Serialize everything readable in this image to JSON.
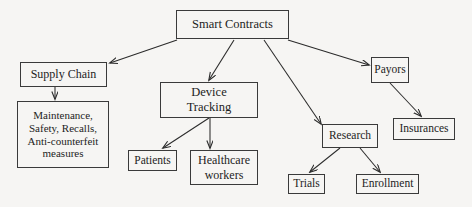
{
  "diagram": {
    "type": "tree-hierarchy",
    "root_label": "Smart Contracts",
    "colors": {
      "background": "#f6f5f3",
      "box_border": "#3a3a3a",
      "text": "#1d1d1d",
      "edge": "#2b2b2b"
    },
    "nodes": [
      {
        "id": "smart",
        "label": "Smart Contracts"
      },
      {
        "id": "supply",
        "label": "Supply Chain"
      },
      {
        "id": "maint",
        "label": "Maintenance,\nSafety, Recalls,\nAnti-counterfeit\nmeasures"
      },
      {
        "id": "device",
        "label": "Device\nTracking"
      },
      {
        "id": "patients",
        "label": "Patients"
      },
      {
        "id": "hcworkers",
        "label": "Healthcare\nworkers"
      },
      {
        "id": "research",
        "label": "Research"
      },
      {
        "id": "trials",
        "label": "Trials"
      },
      {
        "id": "enrollment",
        "label": "Enrollment"
      },
      {
        "id": "payors",
        "label": "Payors"
      },
      {
        "id": "insurances",
        "label": "Insurances"
      }
    ],
    "edges": [
      {
        "from": "smart",
        "to": "supply"
      },
      {
        "from": "smart",
        "to": "device"
      },
      {
        "from": "smart",
        "to": "research"
      },
      {
        "from": "smart",
        "to": "payors"
      },
      {
        "from": "supply",
        "to": "maint"
      },
      {
        "from": "device",
        "to": "patients"
      },
      {
        "from": "device",
        "to": "hcworkers"
      },
      {
        "from": "research",
        "to": "trials"
      },
      {
        "from": "research",
        "to": "enrollment"
      },
      {
        "from": "payors",
        "to": "insurances"
      }
    ]
  }
}
